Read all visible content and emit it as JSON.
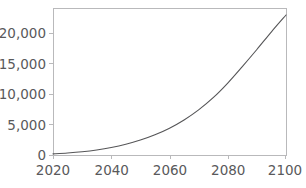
{
  "chart_data": {
    "type": "line",
    "title": "",
    "subtitle": "",
    "xlabel": "",
    "ylabel": "",
    "xlim": [
      2020,
      2100
    ],
    "ylim": [
      0,
      24100
    ],
    "grid": false,
    "legend": null,
    "xticks": [
      2020,
      2040,
      2060,
      2080,
      2100
    ],
    "xtick_labels": [
      "2020",
      "2040",
      "2060",
      "2080",
      "2100"
    ],
    "yticks": [
      0,
      5000,
      10000,
      15000,
      20000
    ],
    "ytick_labels": [
      "0",
      "5,000",
      "10,000",
      "15,000",
      "20,000"
    ],
    "series": [
      {
        "name": "",
        "color": "#555557",
        "line_width": 1.1,
        "x": [
          2020,
          2025,
          2030,
          2035,
          2040,
          2045,
          2050,
          2055,
          2060,
          2065,
          2070,
          2075,
          2080,
          2085,
          2090,
          2095,
          2100
        ],
        "values": [
          190,
          330,
          530,
          820,
          1220,
          1760,
          2450,
          3320,
          4400,
          5750,
          7400,
          9400,
          11800,
          14500,
          17300,
          20200,
          22950
        ]
      }
    ]
  },
  "axes_style": {
    "frame_color": "#b9b9bb",
    "tick_color": "#b9b9bb",
    "text_color": "#59595b",
    "background": "#ffffff"
  },
  "plot_box": {
    "left": 53,
    "right": 286,
    "top": 8,
    "bottom": 155
  }
}
